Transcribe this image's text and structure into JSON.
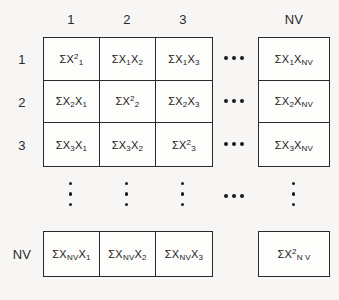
{
  "figure": {
    "background_color": "#f7f6f5",
    "line_color": "#2a2a2a",
    "text_color": "#1a1a1a"
  },
  "headers": {
    "columns": [
      "1",
      "2",
      "3",
      "NV"
    ],
    "rows": [
      "1",
      "2",
      "3",
      "NV"
    ]
  },
  "matrix": {
    "rows": [
      {
        "label": "1",
        "cells": [
          {
            "sigma": "Σ",
            "base": "X",
            "sub": "1",
            "sup": "2",
            "text": "ΣX₁²"
          },
          {
            "sigma": "Σ",
            "base": "X",
            "sub": "1",
            "base2": "X",
            "sub2": "2",
            "text": "ΣX₁X₂"
          },
          {
            "sigma": "Σ",
            "base": "X",
            "sub": "1",
            "base2": "X",
            "sub2": "3",
            "text": "ΣX₁X₃"
          },
          {
            "sigma": "Σ",
            "base": "X",
            "sub": "1",
            "base2": "X",
            "sub2": "NV",
            "text": "ΣX₁X_NV"
          }
        ]
      },
      {
        "label": "2",
        "cells": [
          {
            "sigma": "Σ",
            "base": "X",
            "sub": "2",
            "base2": "X",
            "sub2": "1",
            "text": "ΣX₂X₁"
          },
          {
            "sigma": "Σ",
            "base": "X",
            "sub": "2",
            "sup": "2",
            "text": "ΣX₂²"
          },
          {
            "sigma": "Σ",
            "base": "X",
            "sub": "2",
            "base2": "X",
            "sub2": "3",
            "text": "ΣX₂X₃"
          },
          {
            "sigma": "Σ",
            "base": "X",
            "sub": "2",
            "base2": "X",
            "sub2": "NV",
            "text": "ΣX₂X_NV"
          }
        ]
      },
      {
        "label": "3",
        "cells": [
          {
            "sigma": "Σ",
            "base": "X",
            "sub": "3",
            "base2": "X",
            "sub2": "1",
            "text": "ΣX₃X₁"
          },
          {
            "sigma": "Σ",
            "base": "X",
            "sub": "3",
            "base2": "X",
            "sub2": "2",
            "text": "ΣX₃X₂"
          },
          {
            "sigma": "Σ",
            "base": "X",
            "sub": "3",
            "sup": "2",
            "text": "ΣX₃²"
          },
          {
            "sigma": "Σ",
            "base": "X",
            "sub": "3",
            "base2": "X",
            "sub2": "NV",
            "text": "ΣX₃X_NV"
          }
        ]
      },
      {
        "label": "NV",
        "cells": [
          {
            "sigma": "Σ",
            "base": "X",
            "sub": "NV",
            "base2": "X",
            "sub2": "1",
            "text": "ΣX_NV X₁"
          },
          {
            "sigma": "Σ",
            "base": "X",
            "sub": "NV",
            "base2": "X",
            "sub2": "2",
            "text": "ΣX_NV X₂"
          },
          {
            "sigma": "Σ",
            "base": "X",
            "sub": "NV",
            "base2": "X",
            "sub2": "3",
            "text": "ΣX_NV X₃"
          },
          {
            "sigma": "Σ",
            "base": "X",
            "sub": "N V",
            "sup": "2",
            "text": "ΣX²_N V"
          }
        ]
      }
    ]
  },
  "ellipses": {
    "horizontal_label": "•••",
    "vertical_label": "•••",
    "count_horizontal": 3,
    "count_vertical": 3
  },
  "symbols": {
    "sigma": "Σ",
    "variable": "X",
    "nv": "NV",
    "square": "2"
  }
}
